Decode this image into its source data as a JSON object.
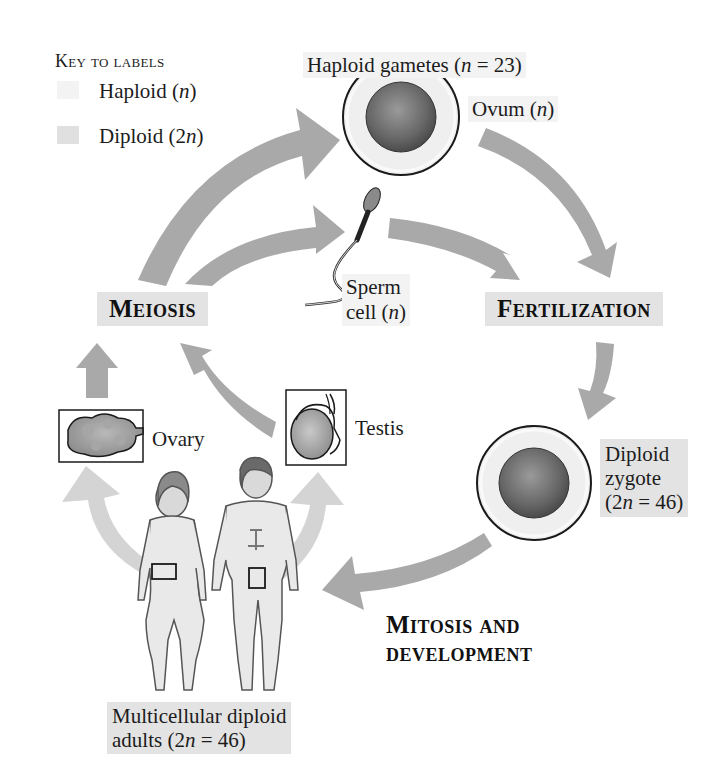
{
  "key": {
    "title": "Key to labels",
    "items": [
      {
        "label_pre": "Haploid (",
        "label_var": "n",
        "label_post": ")",
        "swatch_color": "#f3f3f3"
      },
      {
        "label_pre": "Diploid (2",
        "label_var": "n",
        "label_post": ")",
        "swatch_color": "#e0e0e0"
      }
    ]
  },
  "labels": {
    "gametes_pre": "Haploid gametes (",
    "gametes_var": "n",
    "gametes_post": " = 23)",
    "ovum_pre": "Ovum (",
    "ovum_var": "n",
    "ovum_post": ")",
    "sperm_line1": "Sperm",
    "sperm_line2_pre": "cell (",
    "sperm_line2_var": "n",
    "sperm_line2_post": ")",
    "meiosis": "Meiosis",
    "fertilization": "Fertilization",
    "zygote_line1": "Diploid",
    "zygote_line2": "zygote",
    "zygote_line3_pre": "(2",
    "zygote_line3_var": "n",
    "zygote_line3_post": " = 46)",
    "mitosis_line1": "Mitosis and",
    "mitosis_line2": "development",
    "ovary": "Ovary",
    "testis": "Testis",
    "adults_line1": "Multicellular diploid",
    "adults_line2_pre": "adults (2",
    "adults_line2_var": "n",
    "adults_line2_post": " = 46)"
  },
  "colors": {
    "arrow": "#a9a9a9",
    "arrow_light": "#d2d2d2",
    "haploid_bg": "#f3f3f3",
    "diploid_bg": "#e3e3e3",
    "cell_core": "#6e6e6e",
    "cell_ring": "#ececec"
  }
}
